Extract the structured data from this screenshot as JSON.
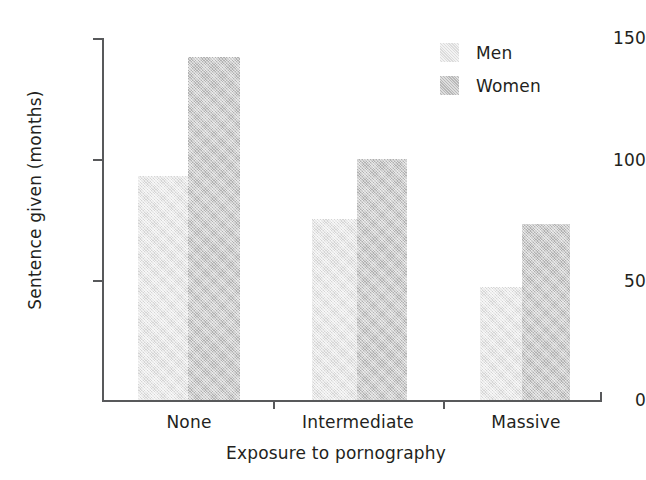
{
  "chart_data": {
    "type": "bar",
    "title": "",
    "subtitle": "",
    "xlabel": "Exposure to pornography",
    "ylabel": "Sentence given (months)",
    "categories": [
      "None",
      "Intermediate",
      "Massive"
    ],
    "series": [
      {
        "name": "Men",
        "color": "#e4e4e4",
        "values": [
          93,
          75,
          47
        ]
      },
      {
        "name": "Women",
        "color": "#c2c2c2",
        "values": [
          142,
          100,
          73
        ]
      }
    ],
    "ylim": [
      0,
      150
    ],
    "yticks": [
      0,
      50,
      100,
      150
    ],
    "ytick_labels": [
      "0",
      "50",
      "100",
      "150"
    ],
    "grid": false,
    "legend_position": "top-right",
    "legend_entries": [
      "Men",
      "Women"
    ],
    "annotations": []
  },
  "axes": {
    "y_title": "Sentence given (months)",
    "x_title": "Exposure to pornography",
    "y_tick_0": "0",
    "y_tick_1": "50",
    "y_tick_2": "100",
    "y_tick_3": "150",
    "x_tick_0": "None",
    "x_tick_1": "Intermediate",
    "x_tick_2": "Massive"
  },
  "legend": {
    "men_label": "Men",
    "women_label": "Women"
  }
}
